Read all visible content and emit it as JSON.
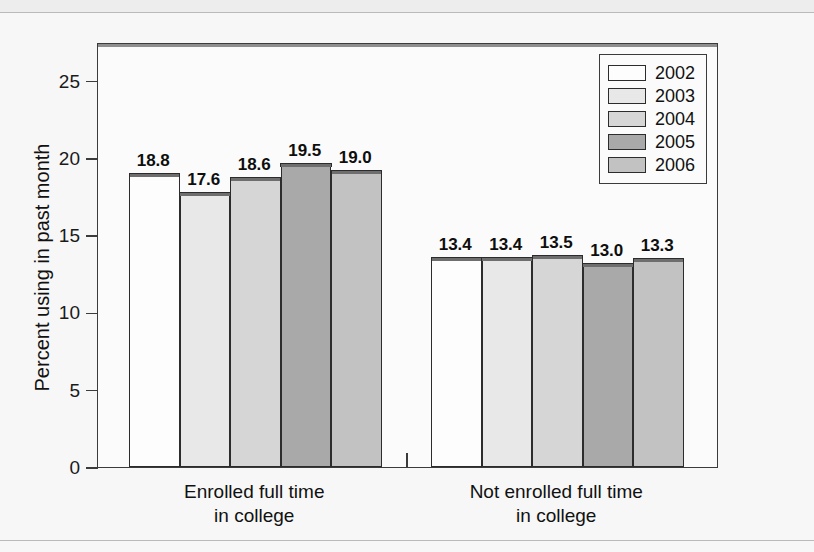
{
  "chart_data": {
    "type": "bar",
    "title": "",
    "xlabel": "",
    "ylabel": "Percent using in past month",
    "ylim": [
      0,
      27.5
    ],
    "yticks": [
      0,
      5,
      10,
      15,
      20,
      25
    ],
    "ytick_labels": [
      "0",
      "5",
      "10",
      "15",
      "20",
      "25"
    ],
    "grid": false,
    "legend_position": "top-right",
    "categories": [
      "Enrolled full time in college",
      "Not enrolled full time in college"
    ],
    "category_lines": [
      [
        "Enrolled full time",
        "in college"
      ],
      [
        "Not enrolled full time",
        "in college"
      ]
    ],
    "series": [
      {
        "name": "2002",
        "color": "#fdfdfd",
        "values": [
          18.8,
          13.4
        ]
      },
      {
        "name": "2003",
        "color": "#e8e8e8",
        "values": [
          17.6,
          13.4
        ]
      },
      {
        "name": "2004",
        "color": "#d6d6d6",
        "values": [
          18.6,
          13.5
        ]
      },
      {
        "name": "2005",
        "color": "#a9a9a9",
        "values": [
          19.5,
          13.0
        ]
      },
      {
        "name": "2006",
        "color": "#c2c2c2",
        "values": [
          19.0,
          13.3
        ]
      }
    ],
    "value_labels": [
      [
        "18.8",
        "17.6",
        "18.6",
        "19.5",
        "19.0"
      ],
      [
        "13.4",
        "13.4",
        "13.5",
        "13.0",
        "13.3"
      ]
    ]
  },
  "legend": {
    "entries": [
      {
        "label": "2002"
      },
      {
        "label": "2003"
      },
      {
        "label": "2004"
      },
      {
        "label": "2005"
      },
      {
        "label": "2006"
      }
    ]
  }
}
